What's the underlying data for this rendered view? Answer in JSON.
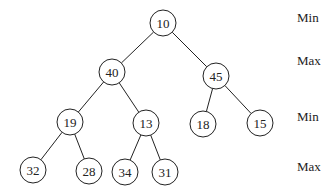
{
  "diagram": {
    "node_radius": 13,
    "nodes": [
      {
        "id": "n0",
        "value": "10",
        "x": 163,
        "y": 23
      },
      {
        "id": "n1",
        "value": "40",
        "x": 112,
        "y": 72
      },
      {
        "id": "n2",
        "value": "45",
        "x": 216,
        "y": 76
      },
      {
        "id": "n3",
        "value": "19",
        "x": 70,
        "y": 122
      },
      {
        "id": "n4",
        "value": "13",
        "x": 146,
        "y": 123
      },
      {
        "id": "n5",
        "value": "18",
        "x": 203,
        "y": 124
      },
      {
        "id": "n6",
        "value": "15",
        "x": 260,
        "y": 123
      },
      {
        "id": "n7",
        "value": "32",
        "x": 33,
        "y": 170
      },
      {
        "id": "n8",
        "value": "28",
        "x": 89,
        "y": 171
      },
      {
        "id": "n9",
        "value": "34",
        "x": 125,
        "y": 172
      },
      {
        "id": "n10",
        "value": "31",
        "x": 165,
        "y": 172
      }
    ],
    "edges": [
      [
        "n0",
        "n1"
      ],
      [
        "n0",
        "n2"
      ],
      [
        "n1",
        "n3"
      ],
      [
        "n1",
        "n4"
      ],
      [
        "n2",
        "n5"
      ],
      [
        "n2",
        "n6"
      ],
      [
        "n3",
        "n7"
      ],
      [
        "n3",
        "n8"
      ],
      [
        "n4",
        "n9"
      ],
      [
        "n4",
        "n10"
      ]
    ],
    "level_labels": [
      {
        "text": "Min",
        "x": 297,
        "y": 23
      },
      {
        "text": "Max",
        "x": 297,
        "y": 66
      },
      {
        "text": "Min",
        "x": 297,
        "y": 122
      },
      {
        "text": "Max",
        "x": 297,
        "y": 172
      }
    ]
  }
}
